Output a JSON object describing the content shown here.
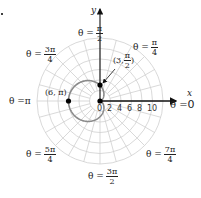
{
  "diagram": {
    "type": "polar-graph",
    "curve": "cardioid",
    "colors": {
      "grid": "#cfcfcf",
      "curve": "#8a8a8a",
      "axis": "#111111",
      "point": "#000000"
    },
    "axes": {
      "x_label": "x",
      "y_label": "y"
    },
    "radial_ticks": [
      "0",
      "2",
      "4",
      "6",
      "8",
      "10"
    ],
    "angle_labels": {
      "zero": {
        "prefix": "θ = ",
        "value": "0"
      },
      "pi4": {
        "prefix": "θ = ",
        "num": "π",
        "den": "4"
      },
      "pi2": {
        "prefix": "θ = ",
        "num": "π",
        "den": "2"
      },
      "3pi4": {
        "prefix": "θ = ",
        "num": "3π",
        "den": "4"
      },
      "pi": {
        "prefix": "θ = ",
        "value": "π"
      },
      "5pi4": {
        "prefix": "θ = ",
        "num": "5π",
        "den": "4"
      },
      "3pi2": {
        "prefix": "θ = ",
        "num": "3π",
        "den": "2"
      },
      "7pi4": {
        "prefix": "θ = ",
        "num": "7π",
        "den": "4"
      }
    },
    "points": {
      "p1": {
        "label": "(6, π)"
      },
      "p2": {
        "label_prefix": "(3, ",
        "num": "π",
        "den": "2",
        "label_suffix": ")"
      }
    }
  }
}
